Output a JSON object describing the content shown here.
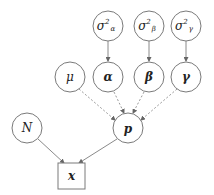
{
  "diagram": {
    "type": "probabilistic-graphical-model",
    "nodes": {
      "sigma_alpha": {
        "label": "σ",
        "sup": "2",
        "sub": "α"
      },
      "sigma_beta": {
        "label": "σ",
        "sup": "2",
        "sub": "β"
      },
      "sigma_gamma": {
        "label": "σ",
        "sup": "2",
        "sub": "γ"
      },
      "mu": {
        "label": "μ"
      },
      "alpha": {
        "label": "α"
      },
      "beta": {
        "label": "β"
      },
      "gamma": {
        "label": "γ"
      },
      "N": {
        "label": "N"
      },
      "p": {
        "label": "p"
      },
      "x": {
        "label": "x",
        "shape": "square",
        "observed": true
      }
    },
    "edges": [
      {
        "from": "sigma_alpha",
        "to": "alpha",
        "style": "solid"
      },
      {
        "from": "sigma_beta",
        "to": "beta",
        "style": "solid"
      },
      {
        "from": "sigma_gamma",
        "to": "gamma",
        "style": "solid"
      },
      {
        "from": "mu",
        "to": "p",
        "style": "dotted"
      },
      {
        "from": "alpha",
        "to": "p",
        "style": "dotted"
      },
      {
        "from": "beta",
        "to": "p",
        "style": "dotted"
      },
      {
        "from": "gamma",
        "to": "p",
        "style": "dotted"
      },
      {
        "from": "N",
        "to": "x",
        "style": "solid"
      },
      {
        "from": "p",
        "to": "x",
        "style": "solid"
      }
    ]
  }
}
